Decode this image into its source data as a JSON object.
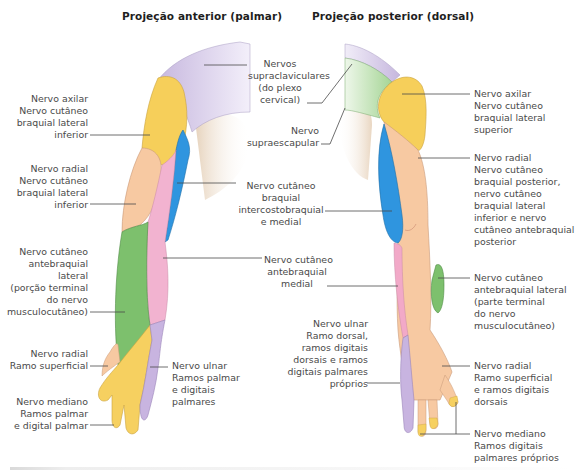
{
  "headings": {
    "anterior": "Projeção anterior (palmar)",
    "posterior": "Projeção posterior (dorsal)"
  },
  "colors": {
    "supraclavicular": "#cfc3e3",
    "axillary": "#f6cf5a",
    "radial": "#f7c9a2",
    "medial_brachial": "#2f95df",
    "medial_antebrachial": "#f2a9c8",
    "lateral_antebrachial": "#7dc06d",
    "ulnar": "#c8b4e0",
    "median": "#f6d060",
    "suprascapular": "#a9d89b",
    "skin_shadow": "#e8d3bd",
    "leader_line": "#4a4a4a"
  },
  "anterior_labels": {
    "axillary": [
      "Nervo axilar",
      "Nervo cutâneo",
      "braquial lateral",
      "inferior"
    ],
    "radial": [
      "Nervo radial",
      "Nervo cutâneo",
      "braquial lateral",
      "inferior"
    ],
    "lateral_antebrachial": [
      "Nervo cutâneo",
      "antebraquial",
      "lateral",
      "(porção terminal",
      "do nervo",
      "musculocutâneo)"
    ],
    "radial_superficial": [
      "Nervo radial",
      "Ramo superficial"
    ],
    "median": [
      "Nervo mediano",
      "Ramos palmar",
      "e digital palmar"
    ],
    "ulnar": [
      "Nervo ulnar",
      "Ramos palmar",
      "e digitais",
      "palmares"
    ]
  },
  "center_labels": {
    "supraclavicular": [
      "Nervos",
      "supraclaviculares",
      "(do plexo",
      "cervical)"
    ],
    "suprascapular": [
      "Nervo",
      "supraescapular"
    ],
    "medial_brachial": [
      "Nervo cutâneo",
      "braquial",
      "intercostobraquial",
      "e medial"
    ],
    "medial_antebrachial": [
      "Nervo cutâneo",
      "antebraquial",
      "medial"
    ]
  },
  "posterior_labels": {
    "axillary": [
      "Nervo axilar",
      "Nervo cutâneo",
      "braquial lateral",
      "superior"
    ],
    "radial": [
      "Nervo radial",
      "Nervo cutâneo",
      "braquial posterior,",
      "nervo cutâneo",
      "braquial lateral",
      "inferior e nervo",
      "cutâneo antebraquial",
      "posterior"
    ],
    "lateral_antebrachial": [
      "Nervo cutâneo",
      "antebraquial lateral",
      "(parte terminal",
      "do nervo",
      "musculocutâneo)"
    ],
    "ulnar": [
      "Nervo ulnar",
      "Ramo dorsal,",
      "ramos digitais",
      "dorsais e ramos",
      "digitais palmares",
      "próprios"
    ],
    "radial_superficial": [
      "Nervo radial",
      "Ramo superficial",
      "e ramos digitais",
      "dorsais"
    ],
    "median": [
      "Nervo mediano",
      "Ramos digitais",
      "palmares próprios"
    ]
  }
}
